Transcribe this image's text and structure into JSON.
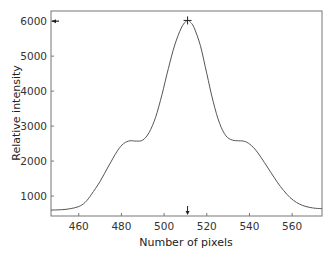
{
  "chart_data": {
    "type": "line",
    "title": "",
    "xlabel": "Number of pixels",
    "ylabel": "Relative intensity",
    "xlim": [
      447,
      574
    ],
    "ylim": [
      430,
      6290
    ],
    "xticks": [
      460,
      480,
      500,
      520,
      540,
      560
    ],
    "yticks": [
      1000,
      2000,
      3000,
      4000,
      5000,
      6000
    ],
    "grid": false,
    "legend": null,
    "series": [
      {
        "name": "intensity profile",
        "color": "#555555",
        "x": [
          447,
          452,
          456,
          460,
          463,
          466,
          470,
          474,
          478,
          481,
          484,
          487,
          490,
          493,
          496,
          499,
          502,
          505,
          508,
          510,
          511,
          512,
          514,
          517,
          520,
          523,
          526,
          529,
          532,
          535,
          538,
          541,
          544,
          547,
          550,
          553,
          556,
          559,
          562,
          565,
          568,
          571,
          574
        ],
        "y": [
          600,
          610,
          640,
          700,
          820,
          1050,
          1420,
          1860,
          2280,
          2500,
          2580,
          2570,
          2600,
          2820,
          3250,
          3900,
          4650,
          5320,
          5800,
          5980,
          6020,
          5990,
          5820,
          5300,
          4500,
          3700,
          3080,
          2720,
          2600,
          2580,
          2560,
          2440,
          2230,
          1960,
          1680,
          1400,
          1160,
          960,
          820,
          730,
          680,
          650,
          640
        ]
      }
    ],
    "annotations": [
      {
        "type": "peak-marker",
        "symbol": "+",
        "x": 511,
        "y": 6020
      },
      {
        "type": "arrow-left",
        "at_axis": "y",
        "value": 6000
      },
      {
        "type": "arrow-down",
        "at_axis": "x",
        "value": 511
      }
    ]
  }
}
